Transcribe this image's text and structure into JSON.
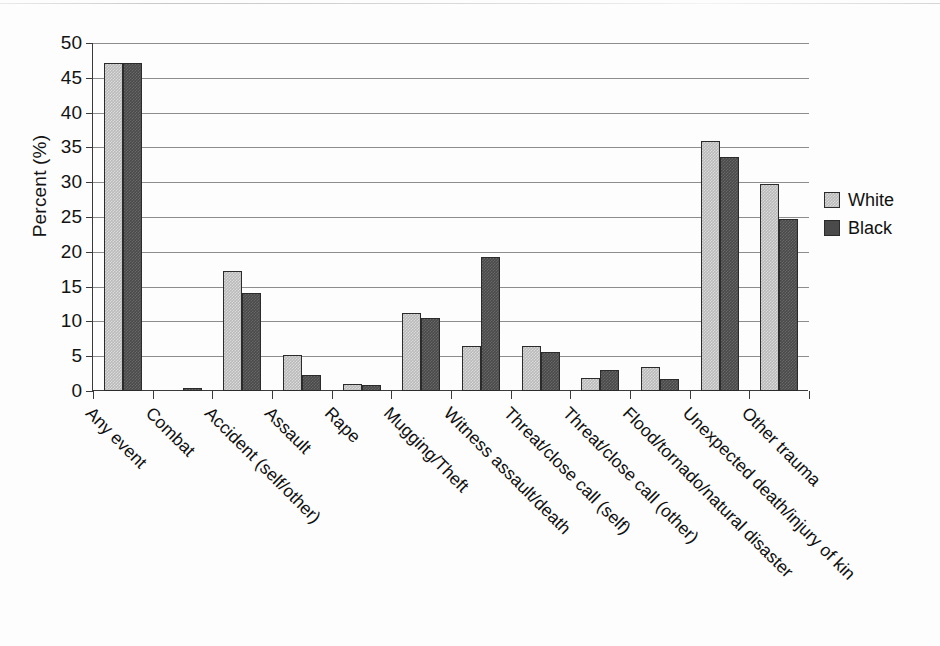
{
  "chart_data": {
    "type": "bar",
    "title": "",
    "subtitle": "",
    "xlabel": "",
    "ylabel": "Percent (%)",
    "ylim": [
      0,
      50
    ],
    "ytick_step": 5,
    "yticks": [
      0,
      5,
      10,
      15,
      20,
      25,
      30,
      35,
      40,
      45,
      50
    ],
    "ytick_labels": [
      "0",
      "5",
      "10",
      "15",
      "20",
      "25",
      "30",
      "35",
      "40",
      "45",
      "50"
    ],
    "grid": true,
    "grid_axis": "y",
    "legend_position": "right",
    "xtick_rotation": 45,
    "categories": [
      "Any event",
      "Combat",
      "Accident (self/other)",
      "Assault",
      "Rape",
      "Mugging/Theft",
      "Witness assault/death",
      "Threat/close call (self)",
      "Threat/close call (other)",
      "Flood/tornado/natural disaster",
      "Unexpected death/injury of kin",
      "Other trauma"
    ],
    "series": [
      {
        "name": "White",
        "color": "#b9b9b9",
        "values": [
          47.1,
          0.0,
          17.2,
          5.2,
          1.0,
          11.2,
          6.4,
          6.4,
          1.8,
          3.4,
          35.9,
          29.7
        ]
      },
      {
        "name": "Black",
        "color": "#4a4a4a",
        "values": [
          47.1,
          0.4,
          14.1,
          2.3,
          0.8,
          10.5,
          19.2,
          5.6,
          3.0,
          1.7,
          33.6,
          24.7
        ]
      }
    ]
  },
  "legend": {
    "entries": [
      {
        "label": "White",
        "swatch": "white"
      },
      {
        "label": "Black",
        "swatch": "black"
      }
    ]
  }
}
